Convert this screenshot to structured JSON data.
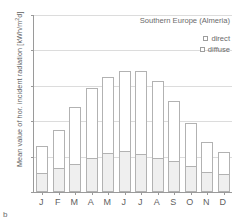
{
  "panel_label": "b",
  "chart_data": {
    "type": "bar",
    "stacked": true,
    "title": "Southern Europe (Almeria)",
    "xlabel": "",
    "ylabel": "Mean value of hor. incident radiation [kWh/m²d]",
    "ylabel_prefix": "Mean value of hor. incident radiation [kWh/m",
    "ylabel_sup": "2",
    "ylabel_suffix": "d]",
    "ylim": [
      0,
      10
    ],
    "yticks": [
      0,
      2,
      4,
      6,
      8,
      10
    ],
    "ytick_labels": [
      "0",
      "2",
      "4",
      "6",
      "8",
      "10"
    ],
    "grid": true,
    "grid_axis": "y",
    "legend_position": "top-right",
    "categories": [
      "J",
      "F",
      "M",
      "A",
      "M",
      "J",
      "J",
      "A",
      "S",
      "O",
      "N",
      "D"
    ],
    "series": [
      {
        "name": "diffuse",
        "color": "#efefef",
        "values": [
          1.1,
          1.35,
          1.6,
          1.9,
          2.2,
          2.3,
          2.15,
          1.95,
          1.75,
          1.45,
          1.15,
          1.0
        ]
      },
      {
        "name": "direct",
        "color": "#ffffff",
        "values": [
          1.5,
          2.15,
          3.2,
          4.0,
          4.3,
          4.55,
          4.7,
          4.3,
          3.4,
          2.45,
          1.65,
          1.25
        ]
      }
    ],
    "totals": [
      2.6,
      3.5,
      4.8,
      5.9,
      6.5,
      6.85,
      6.85,
      6.25,
      5.15,
      3.9,
      2.8,
      2.25
    ]
  },
  "legend": {
    "items": [
      {
        "label": "direct",
        "swatch": "direct"
      },
      {
        "label": "diffuse",
        "swatch": "diffuse"
      }
    ]
  }
}
